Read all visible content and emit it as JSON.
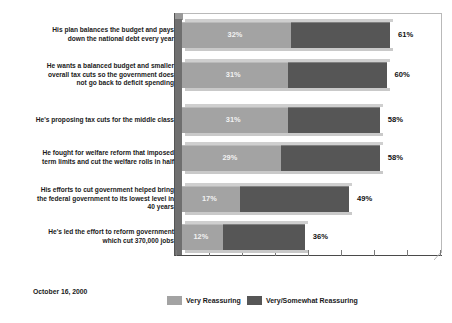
{
  "chart_data": {
    "type": "bar",
    "subtype": "horizontal-stacked-overlap-3d",
    "title": "",
    "xlabel": "",
    "ylabel": "",
    "xlim": [
      0,
      76
    ],
    "grid": false,
    "legend_position": "bottom-center",
    "categories": [
      "His plan balances the budget and pays down the national debt every year",
      "He wants a balanced budget and smaller overall tax cuts so the government does not go back to deficit spending",
      "He's proposing tax cuts for the middle class",
      "He fought for welfare reform that imposed term limits and cut the welfare rolls in half",
      "His efforts to cut government helped bring the federal government to its lowest level in 40 years",
      "He's led the effort to reform government which cut 370,000 jobs"
    ],
    "series": [
      {
        "name": "Very Reassuring",
        "color": "#a3a3a3",
        "values": [
          32,
          31,
          31,
          29,
          17,
          12
        ],
        "value_labels": [
          "32%",
          "31%",
          "31%",
          "29%",
          "17%",
          "12%"
        ]
      },
      {
        "name": "Very/Somewhat Reassuring",
        "color": "#565656",
        "values": [
          61,
          60,
          58,
          58,
          49,
          36
        ],
        "value_labels": [
          "61%",
          "60%",
          "58%",
          "58%",
          "49%",
          "36%"
        ]
      }
    ],
    "annotations": {
      "date": "October 16, 2000"
    }
  },
  "rows": [
    {
      "label_line1": "His plan balances the budget and pays",
      "label_line2": "down the national debt every year",
      "label_line3": "",
      "inner": "32%",
      "total": "61%",
      "inner_value": 32,
      "total_value": 61
    },
    {
      "label_line1": "He wants a balanced budget and smaller",
      "label_line2": "overall tax cuts so the government does",
      "label_line3": "not go back to deficit spending",
      "inner": "31%",
      "total": "60%",
      "inner_value": 31,
      "total_value": 60
    },
    {
      "label_line1": "He's proposing tax cuts for the middle class",
      "label_line2": "",
      "label_line3": "",
      "inner": "31%",
      "total": "58%",
      "inner_value": 31,
      "total_value": 58
    },
    {
      "label_line1": "He fought for welfare reform that imposed",
      "label_line2": "term limits and cut the welfare rolls in half",
      "label_line3": "",
      "inner": "29%",
      "total": "58%",
      "inner_value": 29,
      "total_value": 58
    },
    {
      "label_line1": "His efforts to cut government helped bring",
      "label_line2": "the federal government to its lowest level in",
      "label_line3": "40 years",
      "inner": "17%",
      "total": "49%",
      "inner_value": 17,
      "total_value": 49
    },
    {
      "label_line1": "He's led the effort to reform government",
      "label_line2": "which cut 370,000 jobs",
      "label_line3": "",
      "inner": "12%",
      "total": "36%",
      "inner_value": 12,
      "total_value": 36
    }
  ],
  "legend": {
    "items": [
      {
        "label": "Very Reassuring",
        "color": "#a3a3a3"
      },
      {
        "label": "Very/Somewhat Reassuring",
        "color": "#565656"
      }
    ]
  },
  "footer": {
    "date": "October 16, 2000"
  },
  "title": {
    "text": ""
  }
}
